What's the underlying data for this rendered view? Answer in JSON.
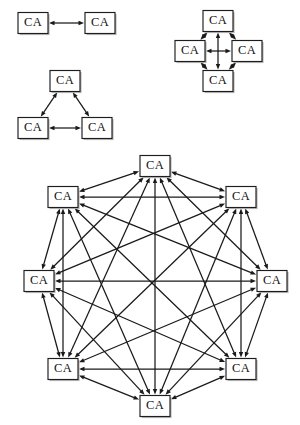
{
  "figure": {
    "node_label": "CA",
    "node_colors": {
      "fill": "#ffffff",
      "border": "#1d1d1d",
      "shadow": "#b9b9b9",
      "edge": "#1a1a1a",
      "text": "#111111",
      "background": "#ffffff"
    },
    "node_size": {
      "w": 30,
      "h": 21
    },
    "arrow": {
      "style": "double-headed",
      "head_length": 5.5,
      "head_width": 4.4
    }
  },
  "diagrams": [
    {
      "id": "pair",
      "name": "two-node-pair",
      "node_count": 2,
      "edge_count": 1,
      "nodes": [
        {
          "id": "p1",
          "label": "CA",
          "cx": 33,
          "cy": 23
        },
        {
          "id": "p2",
          "label": "CA",
          "cx": 100,
          "cy": 23
        }
      ],
      "edges": [
        [
          "p1",
          "p2"
        ]
      ]
    },
    {
      "id": "triangle",
      "name": "three-node-triangle",
      "node_count": 3,
      "edge_count": 3,
      "nodes": [
        {
          "id": "t1",
          "label": "CA",
          "cx": 65,
          "cy": 81
        },
        {
          "id": "t2",
          "label": "CA",
          "cx": 33,
          "cy": 128
        },
        {
          "id": "t3",
          "label": "CA",
          "cx": 97,
          "cy": 128
        }
      ],
      "edges": [
        [
          "t1",
          "t2"
        ],
        [
          "t1",
          "t3"
        ],
        [
          "t2",
          "t3"
        ]
      ]
    },
    {
      "id": "diamond",
      "name": "four-node-diamond",
      "node_count": 4,
      "edge_count": 6,
      "nodes": [
        {
          "id": "d1",
          "label": "CA",
          "cx": 218,
          "cy": 21
        },
        {
          "id": "d2",
          "label": "CA",
          "cx": 190,
          "cy": 51
        },
        {
          "id": "d3",
          "label": "CA",
          "cx": 247,
          "cy": 51
        },
        {
          "id": "d4",
          "label": "CA",
          "cx": 218,
          "cy": 81
        }
      ],
      "edges": [
        [
          "d1",
          "d2"
        ],
        [
          "d1",
          "d3"
        ],
        [
          "d2",
          "d4"
        ],
        [
          "d3",
          "d4"
        ],
        [
          "d2",
          "d3"
        ],
        [
          "d1",
          "d4"
        ]
      ]
    },
    {
      "id": "octagon",
      "name": "eight-node-full-mesh",
      "node_count": 8,
      "edge_count": 28,
      "nodes": [
        {
          "id": "o1",
          "label": "CA",
          "cx": 155,
          "cy": 166
        },
        {
          "id": "o2",
          "label": "CA",
          "cx": 241,
          "cy": 197
        },
        {
          "id": "o3",
          "label": "CA",
          "cx": 272,
          "cy": 281
        },
        {
          "id": "o4",
          "label": "CA",
          "cx": 241,
          "cy": 369
        },
        {
          "id": "o5",
          "label": "CA",
          "cx": 155,
          "cy": 406
        },
        {
          "id": "o6",
          "label": "CA",
          "cx": 63,
          "cy": 369
        },
        {
          "id": "o7",
          "label": "CA",
          "cx": 39,
          "cy": 281
        },
        {
          "id": "o8",
          "label": "CA",
          "cx": 63,
          "cy": 197
        }
      ],
      "edges": [
        [
          "o1",
          "o2"
        ],
        [
          "o1",
          "o3"
        ],
        [
          "o1",
          "o4"
        ],
        [
          "o1",
          "o5"
        ],
        [
          "o1",
          "o6"
        ],
        [
          "o1",
          "o7"
        ],
        [
          "o1",
          "o8"
        ],
        [
          "o2",
          "o3"
        ],
        [
          "o2",
          "o4"
        ],
        [
          "o2",
          "o5"
        ],
        [
          "o2",
          "o6"
        ],
        [
          "o2",
          "o7"
        ],
        [
          "o2",
          "o8"
        ],
        [
          "o3",
          "o4"
        ],
        [
          "o3",
          "o5"
        ],
        [
          "o3",
          "o6"
        ],
        [
          "o3",
          "o7"
        ],
        [
          "o3",
          "o8"
        ],
        [
          "o4",
          "o5"
        ],
        [
          "o4",
          "o6"
        ],
        [
          "o4",
          "o7"
        ],
        [
          "o4",
          "o8"
        ],
        [
          "o5",
          "o6"
        ],
        [
          "o5",
          "o7"
        ],
        [
          "o5",
          "o8"
        ],
        [
          "o6",
          "o7"
        ],
        [
          "o6",
          "o8"
        ],
        [
          "o7",
          "o8"
        ]
      ]
    }
  ]
}
